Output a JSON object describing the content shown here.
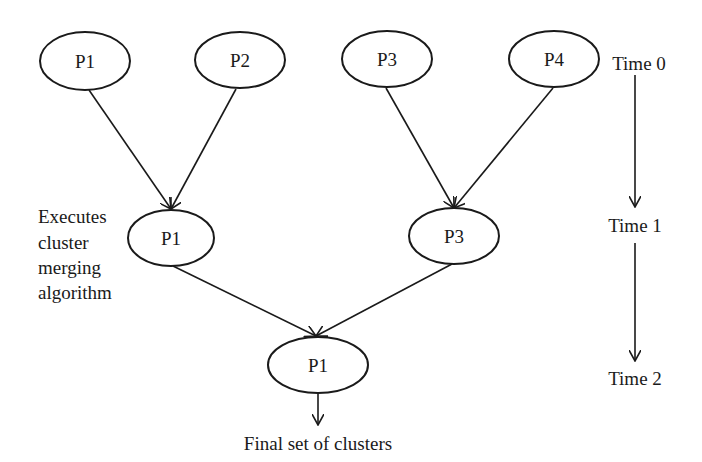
{
  "diagram": {
    "stroke_color": "#1a1a1a",
    "background": "#ffffff",
    "nodes": [
      {
        "id": "p1_t0",
        "label": "P1",
        "level": 0,
        "cx": 85,
        "cy": 61,
        "rx": 45,
        "ry": 29
      },
      {
        "id": "p2_t0",
        "label": "P2",
        "level": 0,
        "cx": 240,
        "cy": 60,
        "rx": 45,
        "ry": 28
      },
      {
        "id": "p3_t0",
        "label": "P3",
        "level": 0,
        "cx": 387,
        "cy": 59,
        "rx": 45,
        "ry": 28
      },
      {
        "id": "p4_t0",
        "label": "P4",
        "level": 0,
        "cx": 554,
        "cy": 59,
        "rx": 45,
        "ry": 28
      },
      {
        "id": "p1_t1",
        "label": "P1",
        "level": 1,
        "cx": 171,
        "cy": 238,
        "rx": 43,
        "ry": 28
      },
      {
        "id": "p3_t1",
        "label": "P3",
        "level": 1,
        "cx": 454,
        "cy": 236,
        "rx": 45,
        "ry": 28
      },
      {
        "id": "p1_t2",
        "label": "P1",
        "level": 2,
        "cx": 318,
        "cy": 365,
        "rx": 50,
        "ry": 28
      }
    ],
    "edges": [
      {
        "from": "p1_t0",
        "to": "p1_t1",
        "x1": 89,
        "y1": 90,
        "x2": 171,
        "y2": 209
      },
      {
        "from": "p2_t0",
        "to": "p1_t1",
        "x1": 236,
        "y1": 89,
        "x2": 171,
        "y2": 209
      },
      {
        "from": "p3_t0",
        "to": "p3_t1",
        "x1": 386,
        "y1": 88,
        "x2": 454,
        "y2": 208
      },
      {
        "from": "p4_t0",
        "to": "p3_t1",
        "x1": 553,
        "y1": 88,
        "x2": 454,
        "y2": 208
      },
      {
        "from": "p1_t1",
        "to": "p1_t2",
        "x1": 173,
        "y1": 266,
        "x2": 316,
        "y2": 336
      },
      {
        "from": "p3_t1",
        "to": "p1_t2",
        "x1": 452,
        "y1": 264,
        "x2": 316,
        "y2": 336
      },
      {
        "from": "p1_t2",
        "to": "output",
        "x1": 318,
        "y1": 394,
        "x2": 318,
        "y2": 425
      }
    ],
    "annotation": {
      "lines": [
        "Executes",
        "cluster",
        "merging",
        "algorithm"
      ]
    },
    "output_label": "Final set of clusters",
    "timeline": {
      "labels": [
        "Time 0",
        "Time 1",
        "Time 2"
      ],
      "x": 635,
      "arrows": [
        {
          "y1": 75,
          "y2": 207
        },
        {
          "y1": 243,
          "y2": 361
        }
      ]
    }
  }
}
